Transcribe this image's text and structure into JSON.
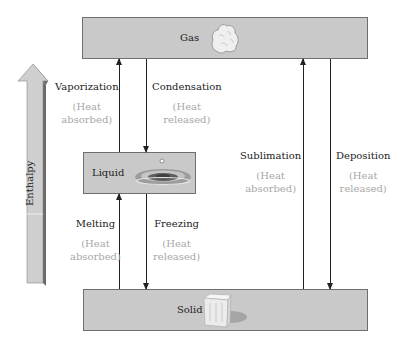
{
  "states": {
    "gas": {
      "label": "Gas",
      "image": "gas-cloud-icon"
    },
    "liquid": {
      "label": "Liquid",
      "image": "water-drop-splash-icon"
    },
    "solid": {
      "label": "Solid",
      "image": "ice-cube-icon"
    }
  },
  "axis": {
    "label": "Enthalpy",
    "direction": "up"
  },
  "processes": [
    {
      "name": "Vaporization",
      "note_line1": "(Heat",
      "note_line2": "absorbed)",
      "from": "Liquid",
      "to": "Gas",
      "direction": "up"
    },
    {
      "name": "Condensation",
      "note_line1": "(Heat",
      "note_line2": "released)",
      "from": "Gas",
      "to": "Liquid",
      "direction": "down"
    },
    {
      "name": "Melting",
      "note_line1": "(Heat",
      "note_line2": "absorbed)",
      "from": "Solid",
      "to": "Liquid",
      "direction": "up"
    },
    {
      "name": "Freezing",
      "note_line1": "(Heat",
      "note_line2": "released)",
      "from": "Liquid",
      "to": "Solid",
      "direction": "down"
    },
    {
      "name": "Sublimation",
      "note_line1": "(Heat",
      "note_line2": "absorbed)",
      "from": "Solid",
      "to": "Gas",
      "direction": "up"
    },
    {
      "name": "Deposition",
      "note_line1": "(Heat",
      "note_line2": "released)",
      "from": "Gas",
      "to": "Solid",
      "direction": "down"
    }
  ],
  "colors": {
    "box_fill": "#c9c9c9",
    "note_text": "#a8a8a8",
    "arrow": "#222222"
  }
}
